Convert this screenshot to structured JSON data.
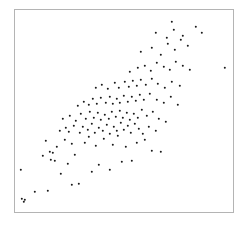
{
  "figure": {
    "background_color": "#ffffff",
    "width": 246,
    "height": 225
  },
  "plot_area": {
    "left": 14,
    "top": 9,
    "right": 234,
    "bottom": 213,
    "border_color": "#b4b4b4",
    "border_width": 1,
    "background_color": "#ffffff"
  },
  "marker": {
    "color": "#1a1a1a",
    "size_px": 2.4,
    "shape": "circle"
  },
  "chart_data": {
    "type": "scatter",
    "title": "",
    "subtitle": "",
    "xlabel": "",
    "ylabel": "",
    "grid": false,
    "legend": null,
    "xlim": [
      0,
      100
    ],
    "ylim": [
      0,
      100
    ],
    "xticks": [],
    "yticks": [],
    "annotations": [],
    "n_points": 128,
    "correlation_description": "strong positive",
    "series": [
      {
        "name": "observations",
        "color": "#1a1a1a",
        "points_px": [
          [
            22,
            199
          ],
          [
            25,
            200
          ],
          [
            24,
            202
          ],
          [
            21,
            170
          ],
          [
            35,
            192
          ],
          [
            48,
            191
          ],
          [
            72,
            185
          ],
          [
            79,
            184
          ],
          [
            61,
            174
          ],
          [
            68,
            164
          ],
          [
            92,
            172
          ],
          [
            43,
            156
          ],
          [
            50,
            152
          ],
          [
            53,
            153
          ],
          [
            51,
            160
          ],
          [
            55,
            161
          ],
          [
            75,
            155
          ],
          [
            99,
            165
          ],
          [
            110,
            170
          ],
          [
            122,
            162
          ],
          [
            132,
            161
          ],
          [
            46,
            141
          ],
          [
            57,
            147
          ],
          [
            65,
            140
          ],
          [
            72,
            144
          ],
          [
            85,
            143
          ],
          [
            89,
            137
          ],
          [
            96,
            146
          ],
          [
            104,
            139
          ],
          [
            113,
            145
          ],
          [
            118,
            136
          ],
          [
            126,
            147
          ],
          [
            137,
            143
          ],
          [
            145,
            140
          ],
          [
            152,
            151
          ],
          [
            161,
            152
          ],
          [
            60,
            131
          ],
          [
            66,
            128
          ],
          [
            69,
            132
          ],
          [
            74,
            126
          ],
          [
            80,
            133
          ],
          [
            83,
            127
          ],
          [
            88,
            130
          ],
          [
            92,
            124
          ],
          [
            95,
            133
          ],
          [
            99,
            128
          ],
          [
            103,
            131
          ],
          [
            107,
            125
          ],
          [
            110,
            134
          ],
          [
            114,
            127
          ],
          [
            117,
            131
          ],
          [
            121,
            123
          ],
          [
            124,
            130
          ],
          [
            128,
            126
          ],
          [
            131,
            133
          ],
          [
            135,
            124
          ],
          [
            139,
            129
          ],
          [
            143,
            134
          ],
          [
            149,
            127
          ],
          [
            156,
            131
          ],
          [
            63,
            119
          ],
          [
            70,
            116
          ],
          [
            76,
            121
          ],
          [
            81,
            114
          ],
          [
            86,
            119
          ],
          [
            90,
            112
          ],
          [
            94,
            118
          ],
          [
            98,
            113
          ],
          [
            101,
            120
          ],
          [
            105,
            115
          ],
          [
            109,
            119
          ],
          [
            112,
            112
          ],
          [
            116,
            117
          ],
          [
            120,
            111
          ],
          [
            123,
            118
          ],
          [
            127,
            113
          ],
          [
            130,
            120
          ],
          [
            134,
            114
          ],
          [
            138,
            118
          ],
          [
            142,
            110
          ],
          [
            147,
            116
          ],
          [
            153,
            112
          ],
          [
            159,
            119
          ],
          [
            166,
            122
          ],
          [
            78,
            106
          ],
          [
            84,
            102
          ],
          [
            89,
            105
          ],
          [
            93,
            99
          ],
          [
            97,
            104
          ],
          [
            101,
            98
          ],
          [
            106,
            103
          ],
          [
            110,
            97
          ],
          [
            113,
            104
          ],
          [
            117,
            99
          ],
          [
            120,
            103
          ],
          [
            124,
            96
          ],
          [
            128,
            102
          ],
          [
            132,
            97
          ],
          [
            136,
            101
          ],
          [
            140,
            95
          ],
          [
            144,
            100
          ],
          [
            150,
            94
          ],
          [
            157,
            100
          ],
          [
            164,
            103
          ],
          [
            171,
            97
          ],
          [
            178,
            105
          ],
          [
            96,
            88
          ],
          [
            102,
            85
          ],
          [
            108,
            89
          ],
          [
            115,
            83
          ],
          [
            119,
            88
          ],
          [
            125,
            82
          ],
          [
            129,
            87
          ],
          [
            133,
            81
          ],
          [
            137,
            86
          ],
          [
            141,
            80
          ],
          [
            146,
            85
          ],
          [
            152,
            79
          ],
          [
            158,
            84
          ],
          [
            165,
            88
          ],
          [
            172,
            82
          ],
          [
            180,
            86
          ],
          [
            130,
            72
          ],
          [
            138,
            68
          ],
          [
            145,
            66
          ],
          [
            151,
            71
          ],
          [
            157,
            63
          ],
          [
            164,
            67
          ],
          [
            170,
            70
          ],
          [
            176,
            62
          ],
          [
            183,
            66
          ],
          [
            190,
            70
          ],
          [
            141,
            52
          ],
          [
            152,
            48
          ],
          [
            161,
            55
          ],
          [
            168,
            44
          ],
          [
            175,
            50
          ],
          [
            181,
            40
          ],
          [
            188,
            46
          ],
          [
            156,
            33
          ],
          [
            167,
            38
          ],
          [
            174,
            30
          ],
          [
            183,
            36
          ],
          [
            172,
            22
          ],
          [
            196,
            27
          ],
          [
            202,
            33
          ],
          [
            225,
            68
          ]
        ]
      }
    ]
  }
}
